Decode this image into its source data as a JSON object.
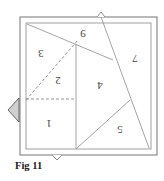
{
  "figure": {
    "caption": "Fig 11",
    "regions": [
      {
        "id": "region-1",
        "label": "1"
      },
      {
        "id": "region-2",
        "label": "2"
      },
      {
        "id": "region-3",
        "label": "3"
      },
      {
        "id": "region-4",
        "label": "4"
      },
      {
        "id": "region-5",
        "label": "5"
      },
      {
        "id": "region-7",
        "label": "7"
      },
      {
        "id": "marker-9",
        "label": "9"
      }
    ],
    "label_orientation": "upside-down",
    "colors": {
      "line": "#9a9a9a",
      "frame": "#8c8c8c",
      "dashed": "#888888",
      "tab_fill": "#cfcfcf"
    }
  }
}
